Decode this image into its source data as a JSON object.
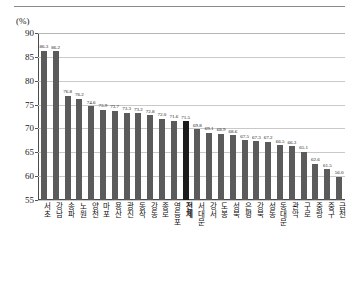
{
  "unit_label": "(%)",
  "colors": {
    "bar": "#5b5b5b",
    "bar_highlight": "#1c1c1c",
    "grid": "#c9c9c9",
    "axis": "#4a4a4a",
    "text": "#171717"
  },
  "chart_data": {
    "type": "bar",
    "title": "",
    "xlabel": "",
    "ylabel": "(%)",
    "ylim": [
      55,
      90
    ],
    "yticks": [
      55,
      60,
      65,
      70,
      75,
      80,
      85,
      90
    ],
    "grid": true,
    "legend": "none",
    "highlight_category": "전체",
    "categories": [
      "서초",
      "강남",
      "송파",
      "노원",
      "양천",
      "마포",
      "용산",
      "광진",
      "동작",
      "강동",
      "종로",
      "영등포",
      "전체",
      "서대문",
      "강서",
      "도봉",
      "성북",
      "은평",
      "강북",
      "성동",
      "동대문",
      "관악",
      "구로",
      "중랑",
      "중구",
      "금천"
    ],
    "values": [
      86.3,
      86.2,
      76.8,
      76.2,
      74.6,
      73.9,
      73.7,
      73.3,
      73.2,
      72.8,
      72.0,
      71.6,
      71.5,
      69.8,
      69.1,
      68.9,
      68.6,
      67.5,
      67.3,
      67.2,
      66.5,
      66.3,
      65.1,
      62.6,
      61.5,
      59.9
    ],
    "last_value_label": "56.0",
    "data_labels": [
      "86.3",
      "86.2",
      "76.8",
      "76.2",
      "74.6",
      "73.9",
      "73.7",
      "73.3",
      "73.2",
      "72.8",
      "72.0",
      "71.6",
      "71.5",
      "69.8",
      "69.1",
      "68.9",
      "68.6",
      "67.5",
      "67.3",
      "67.2",
      "66.5",
      "66.3",
      "65.1",
      "62.6",
      "61.5",
      "56.0"
    ]
  }
}
